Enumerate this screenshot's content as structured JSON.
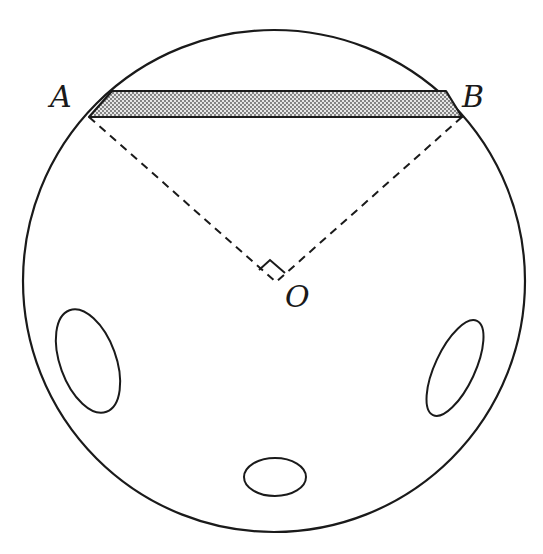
{
  "diagram": {
    "type": "geometry",
    "labels": {
      "A": "A",
      "B": "B",
      "O": "O"
    },
    "colors": {
      "stroke": "#1a1a1a",
      "shade": "#bdbdbd",
      "background": "#ffffff"
    },
    "annotations": {
      "right_angle_at": "O",
      "angle_AOB": "90°"
    }
  }
}
